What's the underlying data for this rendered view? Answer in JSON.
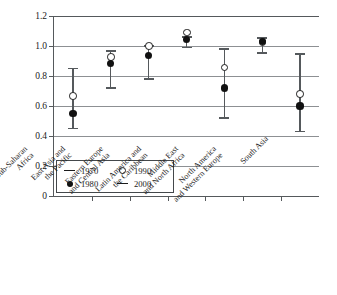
{
  "chart_data": {
    "type": "scatter",
    "title": "",
    "xlabel": "",
    "ylabel": "GPI",
    "ylim": [
      0,
      1.2
    ],
    "yticks": [
      "0",
      "0.2",
      "0.4",
      "0.6",
      "0.8",
      "1.0",
      "1.2"
    ],
    "ytick_values": [
      0,
      0.2,
      0.4,
      0.6,
      0.8,
      1.0,
      1.2
    ],
    "grid": "horizontal",
    "legend_position": "inside-lower-left",
    "legend": [
      {
        "label": "1970",
        "marker": "line"
      },
      {
        "label": "1990",
        "marker": "open-circle"
      },
      {
        "label": "1980",
        "marker": "filled-circle"
      },
      {
        "label": "2000",
        "marker": "line"
      }
    ],
    "categories": [
      "Sub-Saharan Africa",
      "East Asia and the Pacific",
      "Eastern Europe and Central Asia",
      "Latin America and the Caribbean",
      "Middle East and North Africa",
      "North America and Western Europe",
      "South Asia"
    ],
    "category_lines": [
      [
        "Sub-Saharan",
        "Africa"
      ],
      [
        "East Asia and",
        "the Pacific"
      ],
      [
        "Eastern Europe",
        "and Central Asia"
      ],
      [
        "Latin America and",
        "the Caribbean"
      ],
      [
        "Middle East",
        "and North Africa"
      ],
      [
        "North America",
        "and Western Europe"
      ],
      [
        "South Asia"
      ]
    ],
    "series": [
      {
        "name": "1970",
        "marker": "line",
        "values": [
          0.45,
          0.72,
          0.78,
          0.99,
          0.52,
          0.955,
          0.43
        ]
      },
      {
        "name": "1980",
        "marker": "filled-circle",
        "values": [
          0.55,
          0.885,
          0.935,
          1.045,
          0.72,
          1.03,
          0.6
        ]
      },
      {
        "name": "1990",
        "marker": "open-circle",
        "values": [
          0.665,
          0.925,
          1.0,
          1.09,
          0.855,
          1.025,
          0.68
        ]
      },
      {
        "name": "2000",
        "marker": "line",
        "values": [
          0.85,
          0.965,
          1.0,
          1.06,
          0.98,
          1.055,
          0.945
        ]
      }
    ]
  }
}
